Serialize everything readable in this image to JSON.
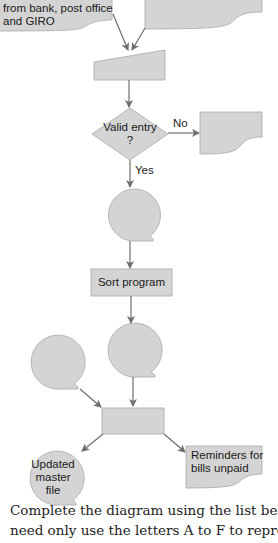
{
  "diagram": {
    "fill_color": "#d4d4d4",
    "stroke_color": "#a8a8a8",
    "arrow_color": "#6e6e6e",
    "nodes": {
      "input_doc_left": {
        "shape": "document",
        "lines": [
          "from bank, post office",
          "and GIRO"
        ]
      },
      "input_doc_right": {
        "shape": "document",
        "lines": []
      },
      "manual_input": {
        "shape": "manual-input",
        "label": ""
      },
      "decision": {
        "shape": "diamond",
        "line1": "Valid entry",
        "line2": "?"
      },
      "error_doc": {
        "shape": "document",
        "label": ""
      },
      "storage_1": {
        "shape": "magnetic-tape",
        "label": ""
      },
      "sort_program": {
        "shape": "process",
        "label": "Sort program"
      },
      "storage_2": {
        "shape": "magnetic-tape",
        "label": ""
      },
      "storage_3": {
        "shape": "magnetic-tape",
        "label": ""
      },
      "update_process": {
        "shape": "process",
        "label": ""
      },
      "updated_master": {
        "shape": "magnetic-tape",
        "lines": [
          "Updated",
          "master",
          "file"
        ]
      },
      "reminders_doc": {
        "shape": "document",
        "lines": [
          "Reminders for",
          "bills unpaid"
        ]
      }
    },
    "edge_labels": {
      "no": "No",
      "yes": "Yes"
    }
  },
  "instructions": {
    "line1": "Complete the diagram using the list below. You",
    "line2": "need only use the letters A to F to represent you"
  }
}
